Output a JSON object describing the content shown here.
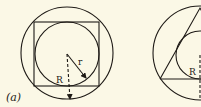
{
  "figure": {
    "panel_a": {
      "caption": "(a)",
      "outer_circle_label": "R",
      "inner_circle_label": "r",
      "shape": "square"
    },
    "panel_b": {
      "outer_circle_label": "R",
      "shape": "triangle"
    },
    "colors": {
      "background": "#fbf8e6",
      "ink": "#1e1a16"
    }
  }
}
